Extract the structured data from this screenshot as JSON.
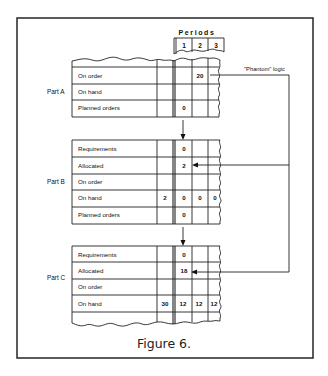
{
  "figure": {
    "caption": "Figure 6.",
    "periods_header": "Periods",
    "periods": [
      "1",
      "2",
      "3"
    ],
    "annotation": "\"Phantom\" logic"
  },
  "parts": [
    {
      "label": "Part A",
      "rows": [
        {
          "label": "On order",
          "past": "",
          "p1": "",
          "p2": "20",
          "p3": ""
        },
        {
          "label": "On hand",
          "past": "",
          "p1": "",
          "p2": "",
          "p3": ""
        },
        {
          "label": "Planned orders",
          "past": "",
          "p1": "0",
          "p2": "",
          "p3": ""
        }
      ]
    },
    {
      "label": "Part B",
      "rows": [
        {
          "label": "Requirements",
          "past": "",
          "p1": "0",
          "p2": "",
          "p3": ""
        },
        {
          "label": "Allocated",
          "past": "",
          "p1": "2",
          "p2": "",
          "p3": ""
        },
        {
          "label": "On order",
          "past": "",
          "p1": "",
          "p2": "",
          "p3": ""
        },
        {
          "label": "On hand",
          "past": "2",
          "p1": "0",
          "p2": "0",
          "p3": "0"
        },
        {
          "label": "Planned orders",
          "past": "",
          "p1": "0",
          "p2": "",
          "p3": ""
        }
      ]
    },
    {
      "label": "Part C",
      "rows": [
        {
          "label": "Requirements",
          "past": "",
          "p1": "0",
          "p2": "",
          "p3": ""
        },
        {
          "label": "Allocated",
          "past": "",
          "p1": "18",
          "p2": "",
          "p3": ""
        },
        {
          "label": "On order",
          "past": "",
          "p1": "",
          "p2": "",
          "p3": ""
        },
        {
          "label": "On hand",
          "past": "30",
          "p1": "12",
          "p2": "12",
          "p3": "12"
        }
      ]
    }
  ]
}
